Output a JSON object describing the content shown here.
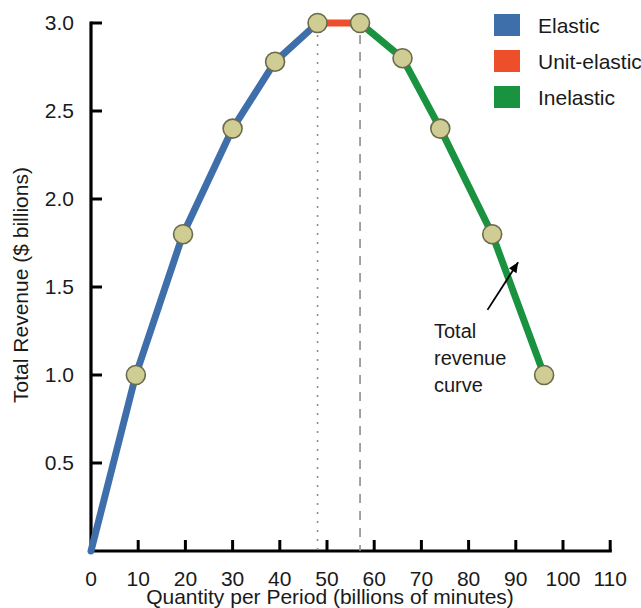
{
  "chart_data": {
    "type": "line",
    "title": "",
    "xlabel": "Quantity per Period (billions of minutes)",
    "ylabel": "Total Revenue ($ billions)",
    "xlim": [
      0,
      110
    ],
    "ylim": [
      0,
      3.0
    ],
    "grid": false,
    "x": [
      0,
      9.5,
      19.5,
      30,
      39,
      48,
      57,
      66,
      74,
      85,
      96
    ],
    "y": [
      0.0,
      1.0,
      1.8,
      2.4,
      2.78,
      3.0,
      3.0,
      2.8,
      2.4,
      1.8,
      1.0
    ],
    "xticks": [
      "0",
      "10",
      "20",
      "30",
      "40",
      "50",
      "60",
      "70",
      "80",
      "90",
      "100",
      "110"
    ],
    "xtick_values": [
      0,
      10,
      20,
      30,
      40,
      50,
      60,
      70,
      80,
      90,
      100,
      110
    ],
    "yticks": [
      "0.5",
      "1.0",
      "1.5",
      "2.0",
      "2.5",
      "3.0"
    ],
    "ytick_values": [
      0.5,
      1.0,
      1.5,
      2.0,
      2.5,
      3.0
    ],
    "series": [
      {
        "name": "Elastic",
        "color": "#3f6fab",
        "x": [
          0,
          9.5,
          19.5,
          30,
          39,
          48
        ],
        "y": [
          0.0,
          1.0,
          1.8,
          2.4,
          2.78,
          3.0
        ]
      },
      {
        "name": "Unit-elastic",
        "color": "#ed4f2a",
        "x": [
          48,
          57
        ],
        "y": [
          3.0,
          3.0
        ]
      },
      {
        "name": "Inelastic",
        "color": "#1a9341",
        "x": [
          57,
          66,
          74,
          85,
          96
        ],
        "y": [
          3.0,
          2.8,
          2.4,
          1.8,
          1.0
        ]
      }
    ],
    "markers": {
      "fill": "#cfcc94",
      "edge": "#6b6a4a",
      "points": [
        {
          "x": 9.5,
          "y": 1.0
        },
        {
          "x": 19.5,
          "y": 1.8
        },
        {
          "x": 30,
          "y": 2.4
        },
        {
          "x": 39,
          "y": 2.78
        },
        {
          "x": 48,
          "y": 3.0
        },
        {
          "x": 57,
          "y": 3.0
        },
        {
          "x": 66,
          "y": 2.8
        },
        {
          "x": 74,
          "y": 2.4
        },
        {
          "x": 85,
          "y": 1.8
        },
        {
          "x": 96,
          "y": 1.0
        }
      ]
    },
    "guides": [
      {
        "x": 48,
        "y_from": 0.0,
        "y_to": 3.0,
        "style": "dotted"
      },
      {
        "x": 57,
        "y_from": 0.0,
        "y_to": 3.0,
        "style": "dashed"
      }
    ],
    "annotations": [
      {
        "text_lines": [
          "Total",
          "revenue",
          "curve"
        ],
        "text_x": 93,
        "arrow_from": {
          "x": 84,
          "y": 1.37
        },
        "arrow_to": {
          "x": 90.5,
          "y": 1.64
        }
      }
    ],
    "legend": {
      "position": "top-right",
      "entries": [
        {
          "label": "Elastic",
          "color": "#3f6fab"
        },
        {
          "label": "Unit-elastic",
          "color": "#ed4f2a"
        },
        {
          "label": "Inelastic",
          "color": "#1a9341"
        }
      ]
    }
  }
}
